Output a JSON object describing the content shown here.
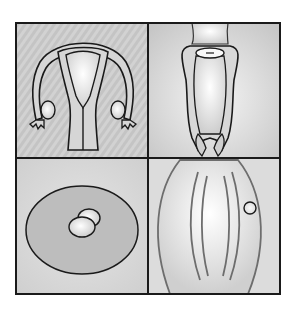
{
  "figure": {
    "title": "",
    "layout": "2x2 grid",
    "panels": [
      {
        "id": "top-left",
        "subject": "uterus-with-fallopian-tubes-and-ovaries",
        "background": "hatched-gray"
      },
      {
        "id": "top-right",
        "subject": "vagina-cervix-longitudinal-view",
        "background": "radial-gray"
      },
      {
        "id": "bottom-left",
        "subject": "ovum-in-follicle",
        "background": "light-gray"
      },
      {
        "id": "bottom-right",
        "subject": "elongated-organ-with-small-circle",
        "background": "light-gray"
      }
    ],
    "colors": {
      "outline": "#1a1a1a",
      "panel_bg": "#c9c9c9",
      "panel_light": "#ebebeb",
      "organ_fill": "#d6d6d6",
      "organ_highlight": "#f7f7f7",
      "follicle_fill": "#b8b8b8",
      "stroke_gray": "#6d6d6d"
    }
  }
}
